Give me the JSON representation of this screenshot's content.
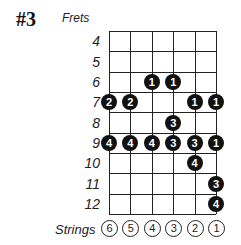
{
  "title": "#3",
  "frets_label": "Frets",
  "strings_label": "Strings",
  "frets": [
    "4",
    "5",
    "6",
    "7",
    "8",
    "9",
    "10",
    "11",
    "12"
  ],
  "strings": [
    "6",
    "5",
    "4",
    "3",
    "2",
    "1"
  ],
  "dots": [
    {
      "fret": 6,
      "string": 4,
      "finger": "1"
    },
    {
      "fret": 6,
      "string": 3,
      "finger": "1"
    },
    {
      "fret": 7,
      "string": 6,
      "finger": "2"
    },
    {
      "fret": 7,
      "string": 5,
      "finger": "2"
    },
    {
      "fret": 7,
      "string": 2,
      "finger": "1"
    },
    {
      "fret": 7,
      "string": 1,
      "finger": "1"
    },
    {
      "fret": 8,
      "string": 3,
      "finger": "3"
    },
    {
      "fret": 9,
      "string": 6,
      "finger": "4"
    },
    {
      "fret": 9,
      "string": 5,
      "finger": "4"
    },
    {
      "fret": 9,
      "string": 4,
      "finger": "4"
    },
    {
      "fret": 9,
      "string": 3,
      "finger": "3"
    },
    {
      "fret": 9,
      "string": 2,
      "finger": "3"
    },
    {
      "fret": 9,
      "string": 1,
      "finger": "1"
    },
    {
      "fret": 10,
      "string": 2,
      "finger": "4"
    },
    {
      "fret": 11,
      "string": 1,
      "finger": "3"
    },
    {
      "fret": 12,
      "string": 1,
      "finger": "4"
    }
  ]
}
